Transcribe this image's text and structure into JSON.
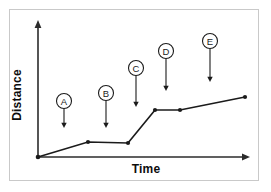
{
  "figure": {
    "background_color": "#ffffff",
    "frame_color": "#c9c9c9",
    "line_color": "#1b1b1b",
    "axis_color": "#2b2b2b"
  },
  "axes": {
    "x_title": "Time",
    "y_title": "Distance",
    "x_title_x": 146,
    "x_title_y": 173,
    "y_title_x": 21,
    "y_title_y": 95,
    "origin": {
      "x": 38,
      "y": 157
    },
    "x_end": {
      "x": 250,
      "y": 157
    },
    "y_end": {
      "x": 38,
      "y": 20
    }
  },
  "callouts": [
    {
      "label": "A",
      "circle_x": 64,
      "circle_y": 101,
      "radius": 7.5,
      "tip_x": 64,
      "tip_y": 128
    },
    {
      "label": "B",
      "circle_x": 106,
      "circle_y": 93,
      "radius": 7.5,
      "tip_x": 106,
      "tip_y": 128
    },
    {
      "label": "C",
      "circle_x": 136,
      "circle_y": 68,
      "radius": 7.5,
      "tip_x": 136,
      "tip_y": 107
    },
    {
      "label": "D",
      "circle_x": 166,
      "circle_y": 51,
      "radius": 7.5,
      "tip_x": 166,
      "tip_y": 91
    },
    {
      "label": "E",
      "circle_x": 210,
      "circle_y": 41,
      "radius": 7.5,
      "tip_x": 210,
      "tip_y": 82
    }
  ],
  "chart_data": {
    "type": "line",
    "title": "",
    "subtitle": "",
    "xlabel": "Time",
    "ylabel": "Distance",
    "grid": false,
    "legend": "none",
    "axis_style": "arrow-headed, unlabeled qualitative axes",
    "xlim": [
      0,
      100
    ],
    "ylim": [
      0,
      100
    ],
    "x_tick_labels": [],
    "y_tick_labels": [],
    "series": [
      {
        "name": "Distance vs Time",
        "x": [
          0,
          23.6,
          42.5,
          55.2,
          67.0,
          97.6
        ],
        "y": [
          0,
          10.9,
          10.2,
          34.3,
          34.3,
          43.8
        ],
        "pixel_points": [
          {
            "x": 38,
            "y": 157
          },
          {
            "x": 88,
            "y": 142
          },
          {
            "x": 128,
            "y": 143
          },
          {
            "x": 155,
            "y": 110
          },
          {
            "x": 180,
            "y": 110
          },
          {
            "x": 245,
            "y": 97
          }
        ]
      }
    ],
    "segment_descriptions": [
      {
        "callout": "A",
        "description": "gentle constant-speed rise from origin"
      },
      {
        "callout": "B",
        "description": "flat segment, object at rest"
      },
      {
        "callout": "C",
        "description": "steep rise, fastest constant speed"
      },
      {
        "callout": "D",
        "description": "flat segment, object at rest again"
      },
      {
        "callout": "E",
        "description": "gentle rise, slow constant speed"
      }
    ],
    "annotations": [
      "A",
      "B",
      "C",
      "D",
      "E"
    ]
  }
}
